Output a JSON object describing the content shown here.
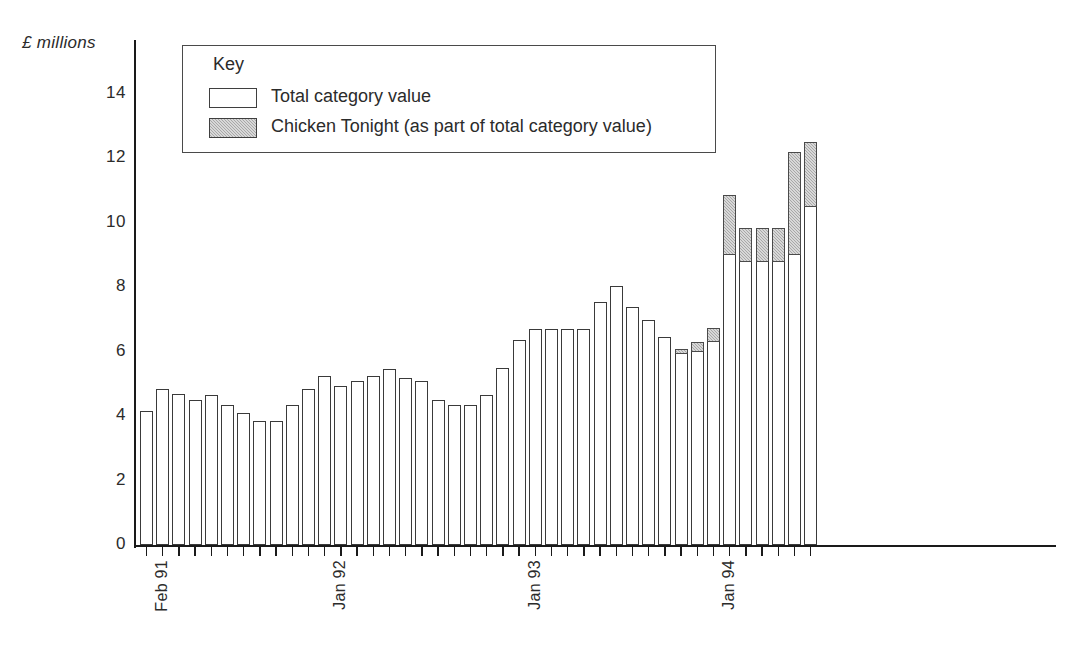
{
  "chart_data": {
    "type": "bar",
    "title": "",
    "subtitle": "",
    "xlabel": "",
    "ylabel": "£ millions",
    "ylim": [
      0,
      15
    ],
    "yticks": [
      0,
      2,
      4,
      6,
      8,
      10,
      12,
      14
    ],
    "ytick_labels": [
      "0",
      "2",
      "4",
      "6",
      "8",
      "10",
      "12",
      "14"
    ],
    "grid": false,
    "stacked": true,
    "legend_position": "top-left",
    "legend_title": "Key",
    "series": [
      {
        "name": "Total category value",
        "swatch": "white-outline",
        "values": [
          4.15,
          4.85,
          4.7,
          4.5,
          4.65,
          4.35,
          4.1,
          3.85,
          3.85,
          4.35,
          4.85,
          5.25,
          4.95,
          5.1,
          5.25,
          5.45,
          5.2,
          5.1,
          4.5,
          4.35,
          4.35,
          4.65,
          5.5,
          6.35,
          6.7,
          6.7,
          6.7,
          6.7,
          7.55,
          8.05,
          7.4,
          7.0,
          6.45,
          6.1,
          6.3,
          6.75,
          10.85,
          9.85,
          9.85,
          9.85,
          12.2,
          12.5
        ]
      },
      {
        "name": "Chicken Tonight (as part of total category value)",
        "swatch": "grey-hatched",
        "values": [
          0,
          0,
          0,
          0,
          0,
          0,
          0,
          0,
          0,
          0,
          0,
          0,
          0,
          0,
          0,
          0,
          0,
          0,
          0,
          0,
          0,
          0,
          0,
          0,
          0,
          0,
          0,
          0,
          0,
          0,
          0,
          0,
          0,
          0.18,
          0.32,
          0.45,
          1.85,
          1.05,
          1.05,
          1.05,
          3.2,
          2.0
        ]
      }
    ],
    "x_tick_labels": [
      {
        "index": 0,
        "label": "Feb 91"
      },
      {
        "index": 11,
        "label": "Jan 92"
      },
      {
        "index": 23,
        "label": "Jan 93"
      },
      {
        "index": 35,
        "label": "Jan 94"
      }
    ],
    "colors": {
      "total_fill": "#ffffff",
      "total_stroke": "#3a3a3a",
      "chicken_tonight_fill": "#a8a8a8",
      "chicken_tonight_stroke": "#4a4a4a",
      "axis": "#1a1a1a",
      "text": "#2b2b2b"
    }
  },
  "legend": {
    "title": "Key",
    "entries": [
      {
        "label": "Total category value",
        "swatch": "total"
      },
      {
        "label": "Chicken Tonight (as part of total category value)",
        "swatch": "ct"
      }
    ]
  },
  "axes": {
    "y_title": "£ millions"
  }
}
